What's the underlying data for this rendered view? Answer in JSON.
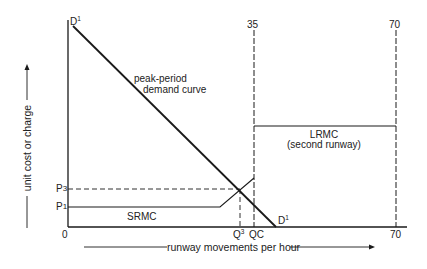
{
  "diagram": {
    "type": "economics-cost-demand-diagram",
    "y_axis_label": "unit cost or charge",
    "x_axis_label": "runway movements per hour",
    "origin_label": "0",
    "demand_curve": {
      "start_label": "D",
      "start_sup": "1",
      "end_label": "D",
      "end_sup": "1",
      "caption_line1": "peak-period",
      "caption_line2": "demand curve"
    },
    "capacity_markers": [
      {
        "top_label": "35",
        "bottom_label": "QC"
      },
      {
        "top_label": "70",
        "bottom_label": "70"
      }
    ],
    "price_labels": [
      {
        "label": "P",
        "sub": "3"
      },
      {
        "label": "P",
        "sub": "1"
      }
    ],
    "quantity_labels": [
      {
        "label": "Q",
        "sup": "3"
      }
    ],
    "srmc_label": "SRMC",
    "lrmc_label_line1": "LRMC",
    "lrmc_label_line2": "(second runway)",
    "colors": {
      "line": "#1a1a1a",
      "text": "#222222",
      "background": "#ffffff"
    }
  }
}
